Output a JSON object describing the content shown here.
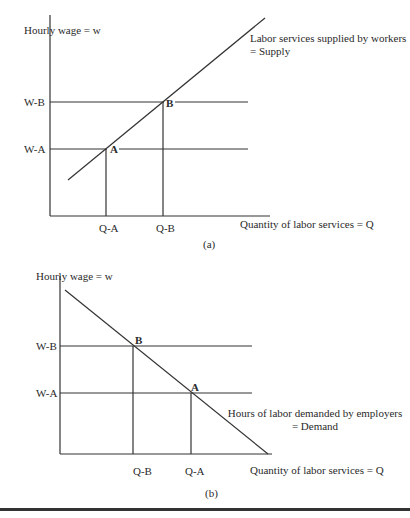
{
  "panel_a": {
    "caption": "(a)",
    "y_axis_label": "Hourly wage = w",
    "x_axis_label": "Quantity of labor services = Q",
    "curve_label_line1": "Labor services supplied by workers",
    "curve_label_line2": "= Supply",
    "y_ticks": [
      "W-B",
      "W-A"
    ],
    "x_ticks": [
      "Q-A",
      "Q-B"
    ],
    "points": [
      "A",
      "B"
    ]
  },
  "panel_b": {
    "caption": "(b)",
    "y_axis_label": "Hourly wage = w",
    "x_axis_label": "Quantity of labor services = Q",
    "curve_label_line1": "Hours of labor demanded by employers",
    "curve_label_line2": "= Demand",
    "y_ticks": [
      "W-B",
      "W-A"
    ],
    "x_ticks": [
      "Q-B",
      "Q-A"
    ],
    "points": [
      "B",
      "A"
    ]
  },
  "colors": {
    "line": "#333333",
    "text": "#2a2a2a",
    "background": "#ffffff"
  }
}
